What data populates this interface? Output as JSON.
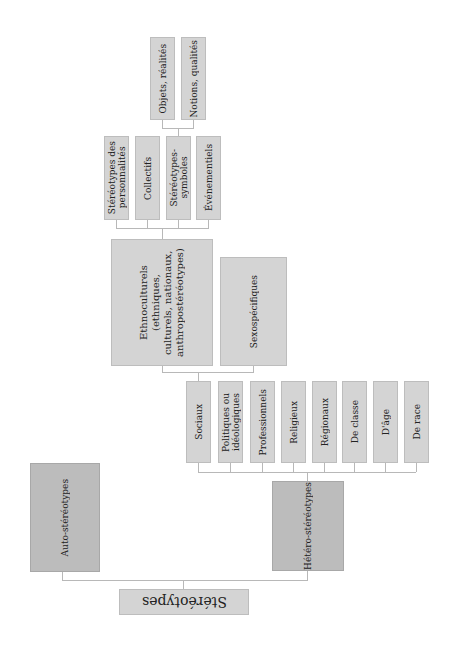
{
  "diagram": {
    "root": "Stéréotypes",
    "level1": [
      {
        "label": "Auto-stéréotypes"
      },
      {
        "label": "Hétéro-stéréotypes"
      }
    ],
    "level2": [
      {
        "label": "Sociaux"
      },
      {
        "label": "Politiques ou\nidéologiques"
      },
      {
        "label": "Professionnels"
      },
      {
        "label": "Religieux"
      },
      {
        "label": "Régionaux"
      },
      {
        "label": "De classe"
      },
      {
        "label": "D'âge"
      },
      {
        "label": "De race"
      }
    ],
    "level3": [
      {
        "label": "Ethnoculturels (ethniques,\nculturels, nationaux,\nanthropostéréotypes)"
      },
      {
        "label": "Sexospécifiques"
      }
    ],
    "level4": [
      {
        "label": "Stéréotypes des\npersonnalités"
      },
      {
        "label": "Collectifs"
      },
      {
        "label": "Stéréotypes-\nsymboles"
      },
      {
        "label": "Événementiels"
      }
    ],
    "level5": [
      {
        "label": "Objets, réalités"
      },
      {
        "label": "Notions, qualités"
      }
    ]
  }
}
